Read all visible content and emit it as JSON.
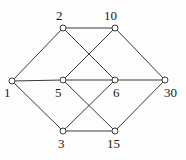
{
  "figure": {
    "width": 186,
    "height": 160,
    "background_color": "#fdfdfd",
    "edge_color": "#3a3a3a",
    "node_fill_color": "#ffffff",
    "node_stroke_color": "#3a3a3a",
    "label_color": "#1b1b1b",
    "node_radius": 3
  },
  "chart_data": {
    "type": "diagram",
    "diagram_kind": "undirected-graph",
    "title": "",
    "xlabel": "",
    "ylabel": "",
    "nodes": [
      {
        "id": "1",
        "label": "1",
        "x": 12,
        "y": 81,
        "label_x": 4,
        "label_y": 86
      },
      {
        "id": "2",
        "label": "2",
        "x": 63,
        "y": 28,
        "label_x": 56,
        "label_y": 9
      },
      {
        "id": "10",
        "label": "10",
        "x": 115,
        "y": 28,
        "label_x": 104,
        "label_y": 9
      },
      {
        "id": "5",
        "label": "5",
        "x": 63,
        "y": 80,
        "label_x": 55,
        "label_y": 86
      },
      {
        "id": "6",
        "label": "6",
        "x": 115,
        "y": 80,
        "label_x": 113,
        "label_y": 86
      },
      {
        "id": "30",
        "label": "30",
        "x": 165,
        "y": 80,
        "label_x": 164,
        "label_y": 86
      },
      {
        "id": "3",
        "label": "3",
        "x": 63,
        "y": 131,
        "label_x": 58,
        "label_y": 137
      },
      {
        "id": "15",
        "label": "15",
        "x": 115,
        "y": 131,
        "label_x": 107,
        "label_y": 137
      }
    ],
    "edges": [
      {
        "from": "1",
        "to": "2",
        "x1": 12,
        "y1": 81,
        "x2": 63,
        "y2": 28
      },
      {
        "from": "1",
        "to": "5",
        "x1": 12,
        "y1": 81,
        "x2": 63,
        "y2": 80
      },
      {
        "from": "1",
        "to": "3",
        "x1": 12,
        "y1": 81,
        "x2": 63,
        "y2": 131
      },
      {
        "from": "2",
        "to": "10",
        "x1": 63,
        "y1": 28,
        "x2": 115,
        "y2": 28
      },
      {
        "from": "2",
        "to": "6",
        "x1": 63,
        "y1": 28,
        "x2": 115,
        "y2": 80
      },
      {
        "from": "10",
        "to": "5",
        "x1": 115,
        "y1": 28,
        "x2": 63,
        "y2": 80
      },
      {
        "from": "10",
        "to": "30",
        "x1": 115,
        "y1": 28,
        "x2": 165,
        "y2": 80
      },
      {
        "from": "5",
        "to": "6",
        "x1": 63,
        "y1": 80,
        "x2": 115,
        "y2": 80
      },
      {
        "from": "5",
        "to": "15",
        "x1": 63,
        "y1": 80,
        "x2": 115,
        "y2": 131
      },
      {
        "from": "6",
        "to": "3",
        "x1": 115,
        "y1": 80,
        "x2": 63,
        "y2": 131
      },
      {
        "from": "6",
        "to": "30",
        "x1": 115,
        "y1": 80,
        "x2": 165,
        "y2": 80
      },
      {
        "from": "3",
        "to": "15",
        "x1": 63,
        "y1": 131,
        "x2": 115,
        "y2": 131
      },
      {
        "from": "15",
        "to": "30",
        "x1": 115,
        "y1": 131,
        "x2": 165,
        "y2": 80
      }
    ]
  }
}
